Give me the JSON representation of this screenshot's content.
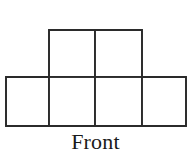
{
  "figure": {
    "kind": "orthographic-cube-stack-front-view",
    "caption": "Front",
    "stroke_color": "#2b2b2b",
    "fill_color": "#ffffff",
    "background_color": "#ffffff",
    "stroke_width": 1.6,
    "cell_width": 45,
    "cell_height": 48,
    "rows": [
      {
        "name": "top-row",
        "square_count": 2,
        "origin_x": 49,
        "origin_y": 30,
        "squares": [
          {
            "label": "top-square-1",
            "x": 49,
            "y": 30,
            "w": 46,
            "h": 47
          },
          {
            "label": "top-square-2",
            "x": 95,
            "y": 30,
            "w": 47,
            "h": 47
          }
        ]
      },
      {
        "name": "bottom-row",
        "square_count": 4,
        "origin_x": 6,
        "origin_y": 77,
        "squares": [
          {
            "label": "bottom-square-1",
            "x": 6,
            "y": 77,
            "w": 43,
            "h": 49
          },
          {
            "label": "bottom-square-2",
            "x": 49,
            "y": 77,
            "w": 46,
            "h": 49
          },
          {
            "label": "bottom-square-3",
            "x": 95,
            "y": 77,
            "w": 47,
            "h": 49
          },
          {
            "label": "bottom-square-4",
            "x": 142,
            "y": 77,
            "w": 44,
            "h": 49
          }
        ]
      }
    ],
    "outline_path": "M6,77 L49,77 L49,30 L142,30 L142,77 L186,77 L186,126 L6,126 Z",
    "interior_lines": [
      {
        "label": "horizontal-divider",
        "x1": 6,
        "y1": 77,
        "x2": 186,
        "y2": 77
      },
      {
        "label": "vertical-divider-1",
        "x1": 49,
        "y1": 77,
        "x2": 49,
        "y2": 126
      },
      {
        "label": "vertical-divider-2",
        "x1": 95,
        "y1": 30,
        "x2": 95,
        "y2": 126
      },
      {
        "label": "vertical-divider-3",
        "x1": 142,
        "y1": 77,
        "x2": 142,
        "y2": 126
      }
    ]
  }
}
